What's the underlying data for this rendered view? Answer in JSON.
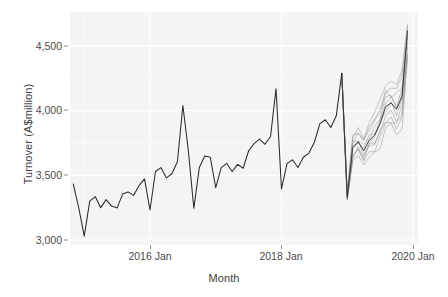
{
  "chart_data": {
    "type": "line",
    "title": "",
    "xlabel": "Month",
    "ylabel": "Turnover (A$million)",
    "ylim": [
      2900,
      4700
    ],
    "xlim": [
      "2014 Jul",
      "2020 Apr"
    ],
    "grid": true,
    "legend": null,
    "yticks": [
      {
        "value": 3000,
        "label": "3,000"
      },
      {
        "value": 3500,
        "label": "3,500"
      },
      {
        "value": 4000,
        "label": "4,000"
      },
      {
        "value": 4500,
        "label": "4,500"
      }
    ],
    "xticks": [
      {
        "value": "2016 Jan",
        "label": "2016 Jan"
      },
      {
        "value": "2018 Jan",
        "label": "2018 Jan"
      },
      {
        "value": "2020 Jan",
        "label": "2020 Jan"
      }
    ],
    "series": [
      {
        "name": "Historical turnover",
        "kind": "observed",
        "color": "#2b2b2b",
        "x": [
          "2014 Nov",
          "2014 Dec",
          "2015 Jan",
          "2015 Feb",
          "2015 Mar",
          "2015 Apr",
          "2015 May",
          "2015 Jun",
          "2015 Jul",
          "2015 Aug",
          "2015 Sep",
          "2015 Oct",
          "2015 Nov",
          "2015 Dec",
          "2016 Jan",
          "2016 Feb",
          "2016 Mar",
          "2016 Apr",
          "2016 May",
          "2016 Jun",
          "2016 Jul",
          "2016 Aug",
          "2016 Sep",
          "2016 Oct",
          "2016 Nov",
          "2016 Dec",
          "2017 Jan",
          "2017 Feb",
          "2017 Mar",
          "2017 Apr",
          "2017 May",
          "2017 Jun",
          "2017 Jul",
          "2017 Aug",
          "2017 Sep",
          "2017 Oct",
          "2017 Nov",
          "2017 Dec",
          "2018 Jan",
          "2018 Feb",
          "2018 Mar",
          "2018 Apr",
          "2018 May",
          "2018 Jun",
          "2018 Jul",
          "2018 Aug",
          "2018 Sep",
          "2018 Oct",
          "2018 Nov",
          "2018 Dec"
        ],
        "values": [
          3432,
          3248,
          3030,
          3300,
          3336,
          3250,
          3312,
          3262,
          3248,
          3355,
          3372,
          3345,
          3420,
          3472,
          3232,
          3530,
          3560,
          3480,
          3512,
          3605,
          4040,
          3690,
          3245,
          3560,
          3650,
          3640,
          3405,
          3560,
          3592,
          3530,
          3585,
          3555,
          3690,
          3745,
          3780,
          3740,
          3800,
          4170,
          3395,
          3590,
          3620,
          3560,
          3640,
          3672,
          3755,
          3900,
          3930,
          3870,
          3960,
          4290
        ]
      },
      {
        "name": "Simulated future sample paths",
        "kind": "forecast-fan",
        "color": "#6e6e6e",
        "n_paths": 10,
        "x": [
          "2019 Jan",
          "2019 Feb",
          "2019 Mar",
          "2019 Apr",
          "2019 May",
          "2019 Jun",
          "2019 Jul",
          "2019 Aug",
          "2019 Sep",
          "2019 Oct",
          "2019 Nov",
          "2019 Dec"
        ],
        "median": [
          3330,
          3710,
          3760,
          3690,
          3770,
          3810,
          3900,
          4030,
          4060,
          4010,
          4110,
          4620
        ],
        "spread_low": [
          3300,
          3610,
          3650,
          3575,
          3640,
          3665,
          3740,
          3850,
          3865,
          3800,
          3885,
          4410
        ],
        "spread_high": [
          3365,
          3805,
          3865,
          3800,
          3895,
          3950,
          4055,
          4200,
          4240,
          4200,
          4315,
          4660
        ]
      }
    ]
  }
}
